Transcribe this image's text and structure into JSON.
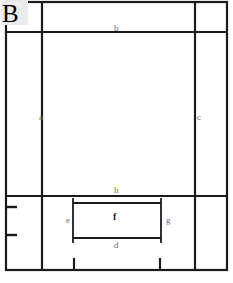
{
  "figure": {
    "panel_letter": "B",
    "background_color": "#ffffff",
    "line_color": "#1a1a1a",
    "label_color": "#6a6a6a",
    "panel_letter_background": "#ebebeb"
  },
  "dimension_labels": [
    {
      "id": "a",
      "text": "a",
      "x": 39,
      "y": 113,
      "style": "light"
    },
    {
      "id": "b",
      "text": "b",
      "x": 114,
      "y": 24,
      "style": "light"
    },
    {
      "id": "c",
      "text": "c",
      "x": 197,
      "y": 113,
      "style": "light"
    },
    {
      "id": "d",
      "text": "d",
      "x": 114,
      "y": 241,
      "style": "light"
    },
    {
      "id": "e",
      "text": "e",
      "x": 66,
      "y": 216,
      "style": "light"
    },
    {
      "id": "f",
      "text": "f",
      "x": 113,
      "y": 212,
      "style": "dark"
    },
    {
      "id": "g",
      "text": "g",
      "x": 166,
      "y": 216,
      "style": "light"
    },
    {
      "id": "h",
      "text": "h",
      "x": 114,
      "y": 186,
      "style": "light"
    }
  ],
  "geometry": {
    "outer_frame": {
      "left": 6,
      "top": 2,
      "right": 227,
      "bottom": 270
    },
    "inner_vertical_left": 42,
    "inner_vertical_right": 195,
    "inner_horizontal_top": 32,
    "inner_horizontal_bottom": 196,
    "inner_rectangle": {
      "left": 73,
      "top": 203,
      "right": 161,
      "bottom": 238
    },
    "left_ticks_y": [
      207,
      235
    ],
    "bottom_ticks_x": [
      74,
      160
    ]
  }
}
